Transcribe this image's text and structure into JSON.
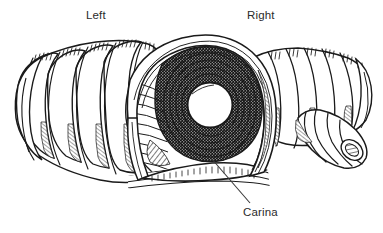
{
  "figure": {
    "style": "black-and-white pen-and-ink medical line drawing",
    "background_color": "#ffffff",
    "ink_color": "#1a1a1a",
    "text_color": "#2b2b2b",
    "width": 383,
    "height": 233
  },
  "labels": {
    "left": "Left",
    "right": "Right",
    "carina": "Carina"
  },
  "leader_line": {
    "from_x": 250,
    "from_y": 203,
    "to_x": 211,
    "to_y": 158
  },
  "anatomy": {
    "left_bronchus": {
      "ring_count": 12,
      "orientation": "tapering to the left"
    },
    "right_bronchus": {
      "ring_count": 9,
      "orientation": "tapering to the right"
    },
    "lobar_branch": {
      "position": "lower right",
      "ring_count": 5,
      "opening": "dark ellipse at tip"
    },
    "lumen": {
      "center_x": 210,
      "center_y": 105,
      "radius": 22,
      "fill": "#ffffff"
    }
  }
}
